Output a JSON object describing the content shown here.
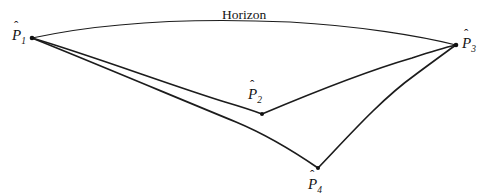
{
  "figure": {
    "background_color": "#ffffff",
    "stroke_color": "#1c1c1c",
    "width": 493,
    "height": 196,
    "horizon_label": "Horizon",
    "points": [
      {
        "id": "P1",
        "label_base": "P",
        "label_sub": "1",
        "hat": "ˆ",
        "x": 32,
        "y": 38
      },
      {
        "id": "P2",
        "label_base": "P",
        "label_sub": "2",
        "hat": "ˆ",
        "x": 262,
        "y": 114
      },
      {
        "id": "P3",
        "label_base": "P",
        "label_sub": "3",
        "hat": "ˆ",
        "x": 456,
        "y": 45
      },
      {
        "id": "P4",
        "label_base": "P",
        "label_sub": "4",
        "hat": "ˆ",
        "x": 318,
        "y": 168
      }
    ],
    "curves": [
      {
        "id": "horizon",
        "name": "horizon-curve",
        "from": "P1",
        "to": "P3",
        "weight": "thin"
      },
      {
        "id": "p1-p2",
        "name": "curve-p1-to-p2",
        "from": "P1",
        "to": "P2",
        "weight": "med"
      },
      {
        "id": "p1-p4",
        "name": "curve-p1-to-p4",
        "from": "P1",
        "to": "P4",
        "weight": "med"
      },
      {
        "id": "p2-p3",
        "name": "curve-p2-to-p3",
        "from": "P2",
        "to": "P3",
        "weight": "med"
      },
      {
        "id": "p4-p3",
        "name": "curve-p4-to-p3",
        "from": "P4",
        "to": "P3",
        "weight": "med"
      }
    ]
  }
}
